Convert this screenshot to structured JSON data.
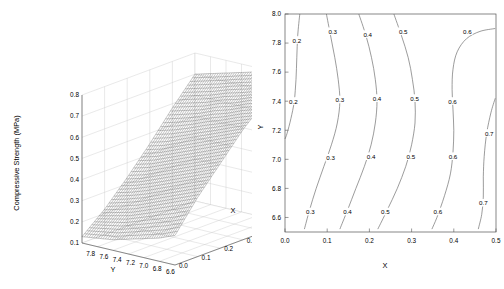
{
  "figure": {
    "panels": [
      "surface-3d",
      "contour"
    ]
  },
  "surface_plot": {
    "z_axis_label": "Compressive Strength (MPa)",
    "x_axis_label": "X",
    "y_axis_label": "Y",
    "z_ticks": [
      "0.1",
      "0.2",
      "0.3",
      "0.4",
      "0.5",
      "0.6",
      "0.7",
      "0.8"
    ],
    "y_ticks": [
      "7.8",
      "7.6",
      "7.4",
      "7.2",
      "7.0",
      "6.8",
      "6.6"
    ],
    "x_ticks": [
      "0.0",
      "0.1",
      "0.2",
      "0.3",
      "0.4",
      "0.5"
    ],
    "mesh_color": "#555555",
    "panel_color": "#ffffff",
    "grid_color": "#c8c8c8"
  },
  "contour_plot": {
    "x_axis_label": "X",
    "y_axis_label": "Y",
    "x_ticks": [
      "0.0",
      "0.1",
      "0.2",
      "0.3",
      "0.4",
      "0.5"
    ],
    "y_ticks": [
      "8.0",
      "7.8",
      "7.6",
      "7.4",
      "7.2",
      "7.0",
      "6.8",
      "6.6"
    ],
    "levels": [
      "0.2",
      "0.3",
      "0.4",
      "0.5",
      "0.6",
      "0.7"
    ],
    "line_color": "#666666",
    "frame_color": "#555555"
  },
  "chart_data": [
    {
      "type": "surface",
      "title": "",
      "xlabel": "X",
      "ylabel": "Y",
      "zlabel": "Compressive Strength (MPa)",
      "xlim": [
        0.0,
        0.5
      ],
      "ylim": [
        6.6,
        7.8
      ],
      "zlim": [
        0.1,
        0.8
      ],
      "xticks": [
        0.0,
        0.1,
        0.2,
        0.3,
        0.4,
        0.5
      ],
      "yticks": [
        7.8,
        7.6,
        7.4,
        7.2,
        7.0,
        6.8,
        6.6
      ],
      "zticks": [
        0.1,
        0.2,
        0.3,
        0.4,
        0.5,
        0.6,
        0.7,
        0.8
      ],
      "y_axis_descending": true,
      "grid": true,
      "legend": "none",
      "description": "Monotonic rising wireframe surface: strength increases sharply with X and rises with decreasing Y, saturating near 0.8 MPa at high X.",
      "z_grid": {
        "x": [
          0.0,
          0.1,
          0.2,
          0.3,
          0.4,
          0.5
        ],
        "y": [
          7.8,
          7.6,
          7.4,
          7.2,
          7.0,
          6.8,
          6.6
        ],
        "z": [
          [
            0.13,
            0.22,
            0.33,
            0.45,
            0.58,
            0.7
          ],
          [
            0.14,
            0.24,
            0.35,
            0.47,
            0.6,
            0.72
          ],
          [
            0.15,
            0.26,
            0.38,
            0.5,
            0.62,
            0.74
          ],
          [
            0.17,
            0.29,
            0.41,
            0.53,
            0.65,
            0.76
          ],
          [
            0.19,
            0.32,
            0.44,
            0.56,
            0.67,
            0.78
          ],
          [
            0.21,
            0.35,
            0.47,
            0.59,
            0.7,
            0.79
          ],
          [
            0.24,
            0.38,
            0.5,
            0.62,
            0.72,
            0.8
          ]
        ]
      }
    },
    {
      "type": "contour",
      "title": "",
      "xlabel": "X",
      "ylabel": "Y",
      "xlim": [
        0.0,
        0.5
      ],
      "ylim": [
        6.5,
        8.0
      ],
      "xticks": [
        0.0,
        0.1,
        0.2,
        0.3,
        0.4,
        0.5
      ],
      "yticks": [
        8.0,
        7.8,
        7.6,
        7.4,
        7.2,
        7.0,
        6.8,
        6.6
      ],
      "levels": [
        0.2,
        0.3,
        0.4,
        0.5,
        0.6,
        0.7
      ],
      "grid": false,
      "legend": "inline-labels",
      "description": "Near-vertical contour bands of compressive strength increasing left to right; contours bow leftward at mid Y and tilt right at low Y.",
      "contour_lines": [
        {
          "level": 0.2,
          "points": [
            [
              0.035,
              8.0
            ],
            [
              0.03,
              7.85
            ],
            [
              0.028,
              7.7
            ],
            [
              0.026,
              7.55
            ],
            [
              0.022,
              7.4
            ],
            [
              0.014,
              7.28
            ],
            [
              0.005,
              7.18
            ],
            [
              0.0,
              7.14
            ]
          ]
        },
        {
          "level": 0.3,
          "points": [
            [
              0.098,
              8.0
            ],
            [
              0.108,
              7.85
            ],
            [
              0.118,
              7.7
            ],
            [
              0.126,
              7.55
            ],
            [
              0.13,
              7.4
            ],
            [
              0.124,
              7.25
            ],
            [
              0.11,
              7.1
            ],
            [
              0.092,
              6.95
            ],
            [
              0.074,
              6.8
            ],
            [
              0.058,
              6.65
            ],
            [
              0.046,
              6.52
            ]
          ]
        },
        {
          "level": 0.4,
          "points": [
            [
              0.175,
              8.0
            ],
            [
              0.192,
              7.85
            ],
            [
              0.205,
              7.7
            ],
            [
              0.214,
              7.55
            ],
            [
              0.218,
              7.4
            ],
            [
              0.214,
              7.25
            ],
            [
              0.204,
              7.1
            ],
            [
              0.188,
              6.95
            ],
            [
              0.168,
              6.8
            ],
            [
              0.148,
              6.65
            ],
            [
              0.13,
              6.52
            ]
          ]
        },
        {
          "level": 0.5,
          "points": [
            [
              0.258,
              8.0
            ],
            [
              0.276,
              7.85
            ],
            [
              0.292,
              7.7
            ],
            [
              0.302,
              7.55
            ],
            [
              0.308,
              7.4
            ],
            [
              0.308,
              7.25
            ],
            [
              0.3,
              7.1
            ],
            [
              0.286,
              6.95
            ],
            [
              0.266,
              6.8
            ],
            [
              0.242,
              6.65
            ],
            [
              0.22,
              6.52
            ]
          ]
        },
        {
          "level": 0.6,
          "points": [
            [
              0.498,
              7.9
            ],
            [
              0.462,
              7.88
            ],
            [
              0.43,
              7.83
            ],
            [
              0.408,
              7.74
            ],
            [
              0.398,
              7.62
            ],
            [
              0.396,
              7.48
            ],
            [
              0.398,
              7.34
            ],
            [
              0.4,
              7.2
            ],
            [
              0.398,
              7.05
            ],
            [
              0.392,
              6.9
            ],
            [
              0.378,
              6.75
            ],
            [
              0.36,
              6.6
            ],
            [
              0.348,
              6.52
            ]
          ]
        },
        {
          "level": 0.7,
          "points": [
            [
              0.498,
              7.42
            ],
            [
              0.488,
              7.32
            ],
            [
              0.478,
              7.18
            ],
            [
              0.472,
              7.02
            ],
            [
              0.47,
              6.88
            ],
            [
              0.47,
              6.74
            ],
            [
              0.466,
              6.62
            ],
            [
              0.458,
              6.52
            ]
          ]
        }
      ],
      "inline_labels": [
        {
          "level": "0.2",
          "x": 0.028,
          "y": 7.82
        },
        {
          "level": "0.2",
          "x": 0.02,
          "y": 7.4
        },
        {
          "level": "0.3",
          "x": 0.113,
          "y": 7.88
        },
        {
          "level": "0.3",
          "x": 0.13,
          "y": 7.41
        },
        {
          "level": "0.3",
          "x": 0.108,
          "y": 7.01
        },
        {
          "level": "0.3",
          "x": 0.06,
          "y": 6.64
        },
        {
          "level": "0.4",
          "x": 0.196,
          "y": 7.86
        },
        {
          "level": "0.4",
          "x": 0.218,
          "y": 7.42
        },
        {
          "level": "0.4",
          "x": 0.204,
          "y": 7.02
        },
        {
          "level": "0.4",
          "x": 0.148,
          "y": 6.64
        },
        {
          "level": "0.5",
          "x": 0.28,
          "y": 7.88
        },
        {
          "level": "0.5",
          "x": 0.307,
          "y": 7.42
        },
        {
          "level": "0.5",
          "x": 0.298,
          "y": 7.02
        },
        {
          "level": "0.5",
          "x": 0.238,
          "y": 6.64
        },
        {
          "level": "0.6",
          "x": 0.432,
          "y": 7.88
        },
        {
          "level": "0.6",
          "x": 0.397,
          "y": 7.4
        },
        {
          "level": "0.6",
          "x": 0.398,
          "y": 7.02
        },
        {
          "level": "0.6",
          "x": 0.362,
          "y": 6.64
        },
        {
          "level": "0.7",
          "x": 0.484,
          "y": 7.18
        },
        {
          "level": "0.7",
          "x": 0.47,
          "y": 6.7
        }
      ]
    }
  ]
}
